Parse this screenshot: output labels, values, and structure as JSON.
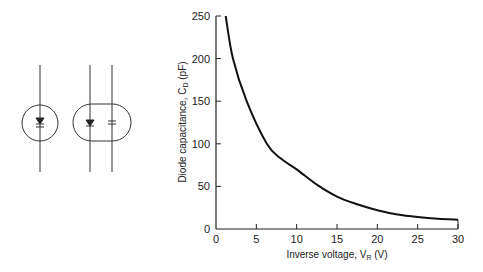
{
  "chart_data": {
    "type": "line",
    "title": "",
    "xlabel": "Inverse voltage, V_R (V)",
    "ylabel": "Diode capacitance, C_D (pF)",
    "xlabel_parts": {
      "main": "Inverse voltage, V",
      "sub": "R",
      "unit": " (V)"
    },
    "ylabel_parts": {
      "main": "Diode capacitance, C",
      "sub": "D",
      "unit": " (pF)"
    },
    "xlim": [
      0,
      30
    ],
    "ylim": [
      0,
      250
    ],
    "xticks": [
      0,
      5,
      10,
      15,
      20,
      25,
      30
    ],
    "yticks": [
      0,
      50,
      100,
      150,
      200,
      250
    ],
    "grid": false,
    "legend": null,
    "series": [
      {
        "name": "C_D vs V_R",
        "x": [
          1.2,
          2.1,
          3.8,
          6.3,
          8.0,
          10,
          12.5,
          15,
          17.5,
          20,
          22.5,
          25,
          27.5,
          30
        ],
        "y": [
          250,
          200,
          150,
          100,
          83,
          70,
          52,
          38,
          29,
          22,
          17,
          14,
          12,
          11
        ]
      }
    ]
  },
  "diagram": {
    "symbols": [
      {
        "name": "varactor-diode-symbol",
        "description": "Single diode with capacitor in circular envelope"
      },
      {
        "name": "diode-capacitor-symbol",
        "description": "Diode and capacitor side by side in rounded envelope"
      }
    ]
  }
}
